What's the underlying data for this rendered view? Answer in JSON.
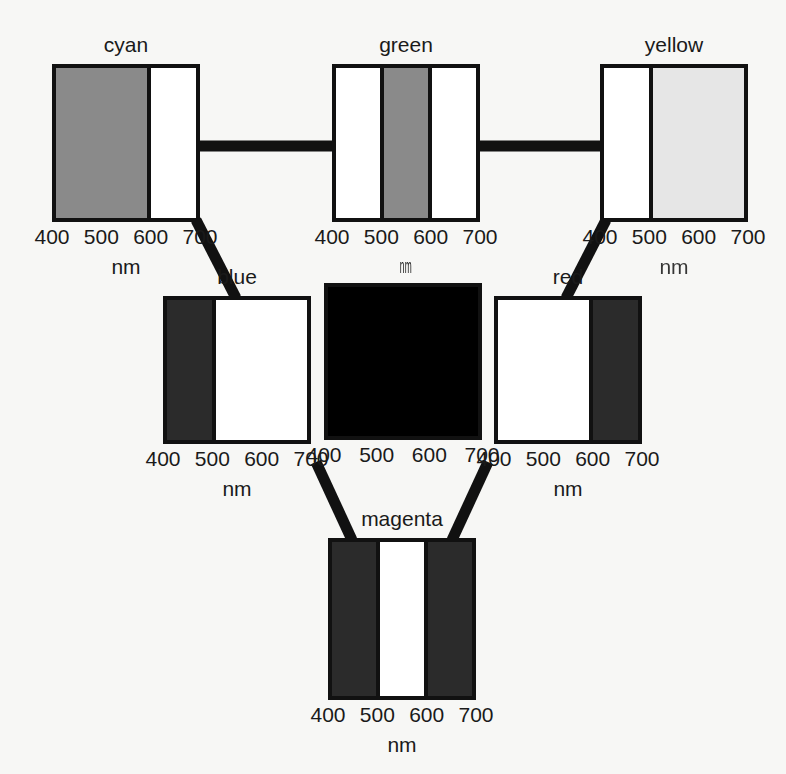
{
  "figure": {
    "background": "#f7f7f5",
    "line_color": "#111111",
    "axis_unit": "nm",
    "axis_unit_green": "nm",
    "tick_labels": [
      "400",
      "500",
      "600",
      "700"
    ]
  },
  "panels": [
    {
      "id": "cyan",
      "label": "cyan",
      "label_position": "above",
      "x": 52,
      "y": 64,
      "w": 148,
      "h": 158,
      "title_color": "#1a1a1a",
      "axis_unit": "nm",
      "ticks": [
        "400",
        "500",
        "600",
        "700"
      ],
      "bands": [
        {
          "range": "400-600",
          "flex": 2,
          "color": "#8a8a8a",
          "name": "reflecting"
        },
        {
          "range": "600-700",
          "flex": 1,
          "color": "#ffffff",
          "name": "absorbing"
        }
      ]
    },
    {
      "id": "green",
      "label": "green",
      "label_position": "above",
      "x": 332,
      "y": 64,
      "w": 148,
      "h": 158,
      "title_color": "#1a1a1a",
      "axis_unit": "nm",
      "ticks": [
        "400",
        "500",
        "600",
        "700"
      ],
      "bands": [
        {
          "range": "400-500",
          "flex": 1,
          "color": "#ffffff",
          "name": "absorbing"
        },
        {
          "range": "500-600",
          "flex": 1,
          "color": "#8a8a8a",
          "name": "reflecting"
        },
        {
          "range": "600-700",
          "flex": 1,
          "color": "#ffffff",
          "name": "absorbing"
        }
      ]
    },
    {
      "id": "yellow",
      "label": "yellow",
      "label_position": "above",
      "x": 600,
      "y": 64,
      "w": 148,
      "h": 158,
      "title_color": "#1a1a1a",
      "axis_unit": "nm",
      "ticks": [
        "400",
        "500",
        "600",
        "700"
      ],
      "bands": [
        {
          "range": "400-500",
          "flex": 1,
          "color": "#ffffff",
          "name": "absorbing"
        },
        {
          "range": "500-700",
          "flex": 2,
          "color": "#e6e6e6",
          "name": "reflecting"
        }
      ]
    },
    {
      "id": "blue",
      "label": "blue",
      "label_position": "above",
      "x": 163,
      "y": 296,
      "w": 148,
      "h": 148,
      "title_color": "#1a1a1a",
      "axis_unit": "nm",
      "ticks": [
        "400",
        "500",
        "600",
        "700"
      ],
      "bands": [
        {
          "range": "400-500",
          "flex": 1,
          "color": "#2b2b2b",
          "name": "reflecting"
        },
        {
          "range": "500-700",
          "flex": 2,
          "color": "#ffffff",
          "name": "absorbing"
        }
      ]
    },
    {
      "id": "black",
      "label": "black",
      "label_position": "inside",
      "x": 324,
      "y": 283,
      "w": 158,
      "h": 157,
      "title_color": "#ffffff",
      "axis_unit": "",
      "ticks": [
        "400",
        "500",
        "600",
        "700"
      ],
      "bands": [
        {
          "range": "400-700",
          "flex": 1,
          "color": "#000000",
          "name": "absorbing-all"
        }
      ]
    },
    {
      "id": "red",
      "label": "red",
      "label_position": "above",
      "x": 494,
      "y": 296,
      "w": 148,
      "h": 148,
      "title_color": "#1a1a1a",
      "axis_unit": "nm",
      "ticks": [
        "400",
        "500",
        "600",
        "700"
      ],
      "bands": [
        {
          "range": "400-600",
          "flex": 2,
          "color": "#ffffff",
          "name": "absorbing"
        },
        {
          "range": "600-700",
          "flex": 1,
          "color": "#2b2b2b",
          "name": "reflecting"
        }
      ]
    },
    {
      "id": "magenta",
      "label": "magenta",
      "label_position": "above",
      "x": 328,
      "y": 538,
      "w": 148,
      "h": 162,
      "title_color": "#1a1a1a",
      "axis_unit": "nm",
      "ticks": [
        "400",
        "500",
        "600",
        "700"
      ],
      "bands": [
        {
          "range": "400-500",
          "flex": 1,
          "color": "#2b2b2b",
          "name": "reflecting"
        },
        {
          "range": "500-600",
          "flex": 1,
          "color": "#ffffff",
          "name": "absorbing"
        },
        {
          "range": "600-700",
          "flex": 1,
          "color": "#2b2b2b",
          "name": "reflecting"
        }
      ]
    }
  ],
  "connectors": [
    {
      "from": "cyan",
      "to": "green",
      "x1": 200,
      "y1": 146,
      "x2": 332,
      "y2": 146,
      "width": 11
    },
    {
      "from": "green",
      "to": "yellow",
      "x1": 480,
      "y1": 146,
      "x2": 600,
      "y2": 146,
      "width": 11
    },
    {
      "from": "cyan",
      "to": "blue",
      "x1": 196,
      "y1": 220,
      "x2": 236,
      "y2": 298,
      "width": 11
    },
    {
      "from": "yellow",
      "to": "red",
      "x1": 606,
      "y1": 220,
      "x2": 566,
      "y2": 298,
      "width": 11
    },
    {
      "from": "blue",
      "to": "magenta",
      "x1": 316,
      "y1": 462,
      "x2": 352,
      "y2": 540,
      "width": 11
    },
    {
      "from": "red",
      "to": "magenta",
      "x1": 488,
      "y1": 462,
      "x2": 452,
      "y2": 540,
      "width": 11
    }
  ]
}
